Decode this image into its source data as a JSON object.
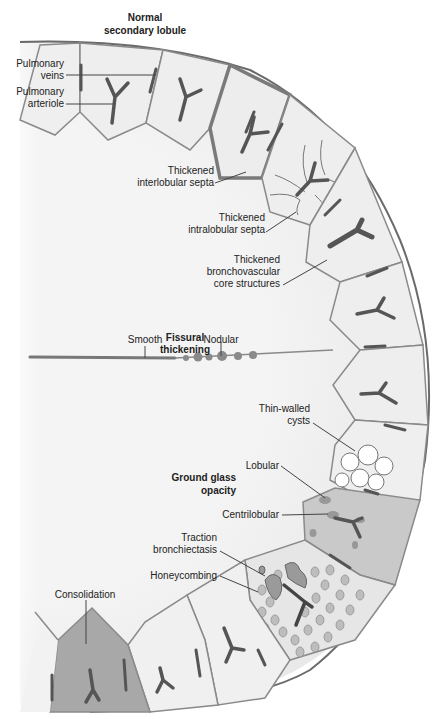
{
  "title": {
    "line1": "Normal",
    "line2": "secondary lobule"
  },
  "labels": {
    "pulmonary_veins": [
      "Pulmonary",
      "veins"
    ],
    "pulmonary_arteriole": [
      "Pulmonary",
      "arteriole"
    ],
    "thickened_interlobular_septa": [
      "Thickened",
      "interlobular septa"
    ],
    "thickened_intralobular_septa": [
      "Thickened",
      "intralobular septa"
    ],
    "thickened_bronchovascular": [
      "Thickened",
      "bronchovascular",
      "core structures"
    ],
    "fissural_thickening": [
      "Fissural",
      "thickening"
    ],
    "smooth": "Smooth",
    "nodular": "Nodular",
    "thin_walled_cysts": [
      "Thin-walled",
      "cysts"
    ],
    "ground_glass_opacity": [
      "Ground glass",
      "opacity"
    ],
    "lobular": "Lobular",
    "centrilobular": "Centrilobular",
    "traction_bronchiectasis": [
      "Traction",
      "bronchiectasis"
    ],
    "honeycombing": "Honeycombing",
    "consolidation": "Consolidation"
  },
  "colors": {
    "background": "#ffffff",
    "lung_fill": "#f1f1f1",
    "lobule_fill": "#ececec",
    "septa_stroke": "#8a8a8a",
    "thick_septa": "#7a7a7a",
    "vessel": "#555555",
    "ggo_fill": "#c9c9c9",
    "consolidation_fill": "#a8a8a8",
    "pleura": "#6a6a6a",
    "text": "#222222"
  }
}
